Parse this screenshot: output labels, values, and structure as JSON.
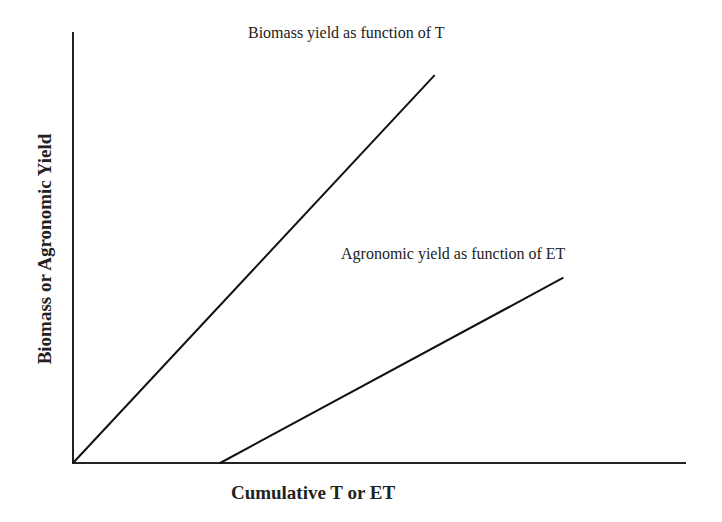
{
  "chart_data": {
    "type": "line",
    "title": "",
    "xlabel": "Cumulative T or ET",
    "ylabel": "Biomass or Agronomic Yield",
    "grid": false,
    "legend": "none (series labeled by inline annotations)",
    "ticks": {
      "x": [],
      "y": []
    },
    "xlim": [
      0,
      100
    ],
    "ylim": [
      0,
      100
    ],
    "series": [
      {
        "name": "Biomass yield as function of T",
        "points": [
          [
            0,
            0
          ],
          [
            59,
            90
          ]
        ]
      },
      {
        "name": "Agronomic yield as function of ET",
        "points": [
          [
            24,
            0
          ],
          [
            80,
            43
          ]
        ]
      }
    ],
    "annotations": [
      {
        "text": "Biomass yield as function of T",
        "series": 0
      },
      {
        "text": "Agronomic yield as function of ET",
        "series": 1
      }
    ]
  },
  "colors": {
    "line": "#111111",
    "axis": "#222222",
    "background": "#ffffff"
  }
}
